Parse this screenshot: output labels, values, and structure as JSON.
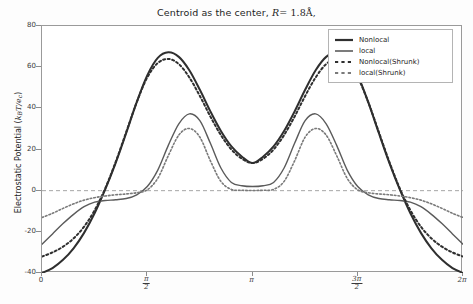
{
  "chart_data": {
    "type": "line",
    "title_prefix": "Centroid as the center,",
    "title_math_var": "R",
    "title_math_value": "= 1.8Å,",
    "xlabel": "",
    "ylabel": "Electrostatic Potential (k_B T/e_c)",
    "ylabel_prefix": "Electrostatic Potential (",
    "ylabel_math": "k",
    "ylabel_math_sub": "B",
    "ylabel_math_rest": "T/e",
    "ylabel_math_sub2": "c",
    "ylabel_suffix": ")",
    "xlim": [
      0,
      6.283185
    ],
    "ylim": [
      -40,
      80
    ],
    "xticks": [
      0,
      1.5707963,
      3.14159265,
      4.71238898,
      6.283185
    ],
    "xticklabels": [
      "0",
      "π/2",
      "π",
      "3π/2",
      "2π"
    ],
    "xticklabels_display": [
      {
        "kind": "plain",
        "text": "0"
      },
      {
        "kind": "frac",
        "num": "π",
        "den": "2"
      },
      {
        "kind": "plain",
        "text": "π"
      },
      {
        "kind": "frac",
        "num": "3π",
        "den": "2"
      },
      {
        "kind": "plain",
        "text": "2π"
      }
    ],
    "yticks": [
      -40,
      -20,
      0,
      20,
      40,
      60,
      80
    ],
    "yticklabels": [
      "-40",
      "-20",
      "0",
      "20",
      "40",
      "60",
      "80"
    ],
    "grid": false,
    "zero_line": true,
    "legend_position": "upper right",
    "colors": {
      "nonlocal": "#2f2f2f",
      "local": "#5b5b5b",
      "nonlocal_shrunk": "#2f2f2f",
      "local_shrunk": "#7a7a7a",
      "axis": "#9a9a9a",
      "zero_line": "#8e8e8e"
    },
    "series": [
      {
        "name": "Nonlocal",
        "style": "solid",
        "color": "#2f2f2f",
        "width": 2.0,
        "x": [
          0.0,
          0.157,
          0.314,
          0.471,
          0.628,
          0.785,
          0.942,
          1.1,
          1.257,
          1.414,
          1.571,
          1.728,
          1.885,
          2.042,
          2.199,
          2.356,
          2.513,
          2.67,
          2.827,
          2.985,
          3.142,
          3.299,
          3.456,
          3.613,
          3.77,
          3.927,
          4.084,
          4.241,
          4.398,
          4.555,
          4.712,
          4.869,
          5.027,
          5.184,
          5.341,
          5.498,
          5.655,
          5.812,
          5.969,
          6.126,
          6.283
        ],
        "y": [
          -40.0,
          -37.6,
          -33.6,
          -28.0,
          -20.5,
          -11.0,
          0.5,
          13.5,
          28.0,
          43.0,
          56.0,
          64.5,
          67.2,
          65.0,
          58.5,
          49.0,
          38.5,
          29.0,
          21.5,
          16.5,
          13.4,
          16.5,
          21.5,
          29.0,
          38.5,
          49.0,
          58.5,
          65.0,
          67.2,
          64.5,
          56.0,
          43.0,
          28.0,
          13.5,
          0.5,
          -11.0,
          -20.5,
          -28.0,
          -33.6,
          -37.6,
          -40.0
        ]
      },
      {
        "name": "local",
        "style": "solid",
        "color": "#5b5b5b",
        "width": 1.4,
        "x": [
          0.0,
          0.157,
          0.314,
          0.471,
          0.628,
          0.785,
          0.942,
          1.1,
          1.257,
          1.414,
          1.571,
          1.728,
          1.885,
          2.042,
          2.199,
          2.356,
          2.513,
          2.67,
          2.827,
          2.985,
          3.142,
          3.299,
          3.456,
          3.613,
          3.77,
          3.927,
          4.084,
          4.241,
          4.398,
          4.555,
          4.712,
          4.869,
          5.027,
          5.184,
          5.341,
          5.498,
          5.655,
          5.812,
          5.969,
          6.126,
          6.283
        ],
        "y": [
          -26.0,
          -21.0,
          -16.0,
          -11.5,
          -7.8,
          -5.6,
          -4.8,
          -4.4,
          -3.8,
          -2.0,
          2.0,
          10.0,
          22.0,
          32.5,
          37.3,
          34.0,
          23.0,
          11.0,
          4.0,
          2.4,
          2.0,
          2.4,
          4.0,
          11.0,
          23.0,
          34.0,
          37.3,
          32.5,
          22.0,
          10.0,
          2.0,
          -2.0,
          -3.8,
          -4.4,
          -4.8,
          -5.6,
          -7.8,
          -11.5,
          -16.0,
          -21.0,
          -26.0
        ]
      },
      {
        "name": "Nonlocal(Shrunk)",
        "style": "dotted",
        "color": "#2f2f2f",
        "width": 2.0,
        "x": [
          0.0,
          0.157,
          0.314,
          0.471,
          0.628,
          0.785,
          0.942,
          1.1,
          1.257,
          1.414,
          1.571,
          1.728,
          1.885,
          2.042,
          2.199,
          2.356,
          2.513,
          2.67,
          2.827,
          2.985,
          3.142,
          3.299,
          3.456,
          3.613,
          3.77,
          3.927,
          4.084,
          4.241,
          4.398,
          4.555,
          4.712,
          4.869,
          5.027,
          5.184,
          5.341,
          5.498,
          5.655,
          5.812,
          5.969,
          6.126,
          6.283
        ],
        "y": [
          -32.0,
          -30.0,
          -27.2,
          -23.2,
          -17.5,
          -9.5,
          1.0,
          14.0,
          28.5,
          43.0,
          55.0,
          62.0,
          64.0,
          61.5,
          55.0,
          46.0,
          36.0,
          27.0,
          20.0,
          15.5,
          13.4,
          15.5,
          20.0,
          27.0,
          36.0,
          46.0,
          55.0,
          61.5,
          64.0,
          62.0,
          55.0,
          43.0,
          28.5,
          14.0,
          1.0,
          -9.5,
          -17.5,
          -23.2,
          -27.2,
          -30.0,
          -32.0
        ]
      },
      {
        "name": "local(Shrunk)",
        "style": "dotted",
        "color": "#7a7a7a",
        "width": 1.6,
        "x": [
          0.0,
          0.157,
          0.314,
          0.471,
          0.628,
          0.785,
          0.942,
          1.1,
          1.257,
          1.414,
          1.571,
          1.728,
          1.885,
          2.042,
          2.199,
          2.356,
          2.513,
          2.67,
          2.827,
          2.985,
          3.142,
          3.299,
          3.456,
          3.613,
          3.77,
          3.927,
          4.084,
          4.241,
          4.398,
          4.555,
          4.712,
          4.869,
          5.027,
          5.184,
          5.341,
          5.498,
          5.655,
          5.812,
          5.969,
          6.126,
          6.283
        ],
        "y": [
          -13.0,
          -11.0,
          -8.6,
          -6.4,
          -4.6,
          -3.4,
          -2.6,
          -2.0,
          -1.6,
          -1.0,
          0.4,
          6.0,
          17.0,
          27.0,
          30.2,
          26.0,
          14.5,
          4.5,
          0.6,
          0.2,
          0.1,
          0.2,
          0.6,
          4.5,
          14.5,
          26.0,
          30.2,
          27.0,
          17.0,
          6.0,
          0.4,
          -1.0,
          -1.6,
          -2.0,
          -2.6,
          -3.4,
          -4.6,
          -6.4,
          -8.6,
          -11.0,
          -13.0
        ]
      }
    ],
    "legend_entries": [
      {
        "label": "Nonlocal",
        "style": "solid",
        "color": "#2f2f2f"
      },
      {
        "label": "local",
        "style": "solid",
        "color": "#5b5b5b"
      },
      {
        "label": "Nonlocal(Shrunk)",
        "style": "dotted",
        "color": "#2f2f2f"
      },
      {
        "label": "local(Shrunk)",
        "style": "dotted",
        "color": "#7a7a7a"
      }
    ]
  }
}
